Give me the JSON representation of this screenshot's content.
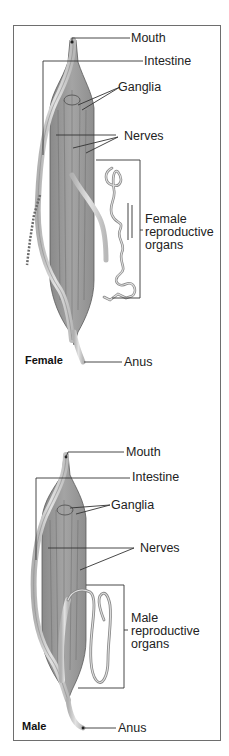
{
  "figure": {
    "female": {
      "title": "Female",
      "labels": {
        "mouth": "Mouth",
        "intestine": "Intestine",
        "ganglia": "Ganglia",
        "nerves": "Nerves",
        "repro_line1": "Female",
        "repro_line2": "reproductive",
        "repro_line3": "organs",
        "anus": "Anus"
      }
    },
    "male": {
      "title": "Male",
      "labels": {
        "mouth": "Mouth",
        "intestine": "Intestine",
        "ganglia": "Ganglia",
        "nerves": "Nerves",
        "repro_line1": "Male",
        "repro_line2": "reproductive",
        "repro_line3": "organs",
        "anus": "Anus"
      }
    },
    "colors": {
      "frame": "#6e6e6e",
      "body_fill": "#9a9a9a",
      "body_dark": "#7c7c7c",
      "tissue_light": "#c8c8c8",
      "leader_line": "#333333"
    }
  }
}
